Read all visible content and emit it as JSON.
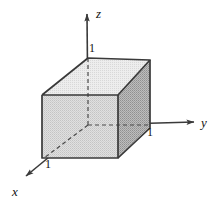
{
  "figure": {
    "kind": "3d-coordinate-axes-with-unit-cube",
    "background_color": "#ffffff",
    "axes": {
      "origin": {
        "x": 88,
        "y": 125
      },
      "line_color": "#3a3a3a",
      "items": [
        {
          "name": "z",
          "label": "z",
          "label_x": 96,
          "label_y": 18,
          "tip_x": 87,
          "tip_y": 12,
          "direction": "up"
        },
        {
          "name": "y",
          "label": "y",
          "label_x": 201,
          "label_y": 127,
          "tip_x": 196,
          "tip_y": 122,
          "direction": "right"
        },
        {
          "name": "x",
          "label": "x",
          "label_x": 12,
          "label_y": 196,
          "tip_x": 24,
          "tip_y": 178,
          "direction": "down-left"
        }
      ]
    },
    "tick_labels": [
      {
        "axis": "z",
        "value": "1",
        "x": 89,
        "y": 52
      },
      {
        "axis": "y",
        "value": "1",
        "x": 147,
        "y": 136
      },
      {
        "axis": "x",
        "value": "1",
        "x": 45,
        "y": 168
      }
    ],
    "cube": {
      "description": "unit cube with one vertex at the origin spanning 1 unit along x, y and z",
      "edge_color": "#3a3a3a",
      "hidden_edge_style": "dashed",
      "faces": [
        {
          "name": "top-face",
          "fill": "#e2e2e2"
        },
        {
          "name": "front-face",
          "fill": "#d2d2d2"
        },
        {
          "name": "right-face",
          "fill": "#a8a8a8"
        }
      ],
      "vertices": {
        "origin_back_bottom": {
          "x": 88,
          "y": 125
        },
        "back_bottom_right": {
          "x": 150,
          "y": 125
        },
        "back_top_left": {
          "x": 88,
          "y": 58
        },
        "back_top_right": {
          "x": 150,
          "y": 60
        },
        "front_bottom_left": {
          "x": 44,
          "y": 158
        },
        "front_bottom_right": {
          "x": 118,
          "y": 158
        },
        "front_top_left": {
          "x": 42,
          "y": 95
        },
        "front_top_right": {
          "x": 118,
          "y": 95
        }
      }
    }
  }
}
